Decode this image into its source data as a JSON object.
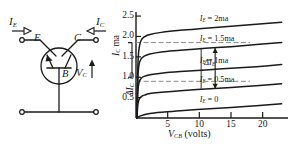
{
  "figure": {
    "kind": "transistor-common-base-characteristics",
    "ink_color": "#1a1a1a",
    "dash_color": "#8a8a8a",
    "background": "#ffffff"
  },
  "circuit": {
    "name": "common-base-transistor-circuit",
    "terminal_labels": {
      "emitter": "E",
      "collector": "C",
      "base": "B"
    },
    "current_labels": {
      "emitter_current": "I",
      "emitter_current_sub": "E",
      "collector_current": "I",
      "collector_current_sub": "C"
    },
    "voltage_label": {
      "symbol": "V",
      "sub": "C"
    }
  },
  "chart_data": {
    "type": "line",
    "title": "",
    "xlabel": "V_CB (volts)",
    "ylabel": "I_C ma",
    "xlabel_parts": {
      "symbol": "V",
      "sub": "CB",
      "unit": "(volts)"
    },
    "ylabel_parts": {
      "symbol": "I",
      "sub": "C",
      "unit": "ma"
    },
    "xlim": [
      0,
      24
    ],
    "ylim": [
      0,
      2.6
    ],
    "xticks": [
      5,
      10,
      15,
      20
    ],
    "xtick_labels": [
      "5",
      "10",
      "15",
      "20"
    ],
    "yticks": [
      0.5,
      1.0,
      1.5,
      2.0,
      2.5
    ],
    "ytick_labels": [
      "0.5",
      "1.0",
      "1.5",
      "2.0",
      "2.5"
    ],
    "grid": false,
    "legend": "inline-curve-labels",
    "series": [
      {
        "name": "I_E = 2ma",
        "label": "I",
        "label_sub": "E",
        "label_rest": " = 2ma",
        "i_e_ma": 2.0,
        "points": [
          [
            0.15,
            0.0
          ],
          [
            0.3,
            1.3
          ],
          [
            0.5,
            1.72
          ],
          [
            0.8,
            1.9
          ],
          [
            1.3,
            1.99
          ],
          [
            2.2,
            2.05
          ],
          [
            4,
            2.1
          ],
          [
            7,
            2.15
          ],
          [
            11,
            2.2
          ],
          [
            15,
            2.25
          ],
          [
            19,
            2.3
          ],
          [
            23,
            2.35
          ]
        ]
      },
      {
        "name": "I_E = 1.5ma",
        "label": "I",
        "label_sub": "E",
        "label_rest": " = 1.5ma",
        "i_e_ma": 1.5,
        "points": [
          [
            0.15,
            0.0
          ],
          [
            0.3,
            1.0
          ],
          [
            0.5,
            1.32
          ],
          [
            0.8,
            1.45
          ],
          [
            1.3,
            1.52
          ],
          [
            2.2,
            1.57
          ],
          [
            4,
            1.62
          ],
          [
            7,
            1.66
          ],
          [
            11,
            1.71
          ],
          [
            15,
            1.75
          ],
          [
            19,
            1.8
          ],
          [
            23,
            1.85
          ]
        ]
      },
      {
        "name": "I_E = 1ma",
        "label": "I",
        "label_sub": "E",
        "label_rest": " = 1ma",
        "i_e_ma": 1.0,
        "points": [
          [
            0.15,
            0.0
          ],
          [
            0.3,
            0.66
          ],
          [
            0.5,
            0.88
          ],
          [
            0.8,
            0.97
          ],
          [
            1.3,
            1.02
          ],
          [
            2.2,
            1.06
          ],
          [
            4,
            1.1
          ],
          [
            7,
            1.14
          ],
          [
            11,
            1.18
          ],
          [
            15,
            1.22
          ],
          [
            19,
            1.26
          ],
          [
            23,
            1.31
          ]
        ]
      },
      {
        "name": "I_E = 0.5ma",
        "label": "I",
        "label_sub": "E",
        "label_rest": " = 0.5ma",
        "i_e_ma": 0.5,
        "points": [
          [
            0.15,
            0.0
          ],
          [
            0.3,
            0.34
          ],
          [
            0.5,
            0.46
          ],
          [
            0.8,
            0.52
          ],
          [
            1.3,
            0.56
          ],
          [
            2.2,
            0.6
          ],
          [
            4,
            0.63
          ],
          [
            7,
            0.67
          ],
          [
            11,
            0.71
          ],
          [
            15,
            0.75
          ],
          [
            19,
            0.79
          ],
          [
            23,
            0.84
          ]
        ]
      },
      {
        "name": "I_E = 0",
        "label": "I",
        "label_sub": "E",
        "label_rest": " = 0",
        "i_e_ma": 0.0,
        "points": [
          [
            0.15,
            0.0
          ],
          [
            0.5,
            0.04
          ],
          [
            1.3,
            0.08
          ],
          [
            2.2,
            0.11
          ],
          [
            4,
            0.14
          ],
          [
            7,
            0.18
          ],
          [
            11,
            0.22
          ],
          [
            15,
            0.26
          ],
          [
            19,
            0.3
          ],
          [
            23,
            0.35
          ]
        ]
      }
    ],
    "annotations": {
      "delta_ic": {
        "symbol": "ΔI",
        "sub": "C",
        "from_ma": 1.0,
        "to_ma": 1.85
      },
      "delta_ie": {
        "symbol": "ΔI",
        "sub": "E",
        "at_volts": 12.5,
        "from_ma": 0.72,
        "to_ma": 1.72
      },
      "dashed_levels_ma": [
        1.85,
        0.9
      ]
    }
  }
}
